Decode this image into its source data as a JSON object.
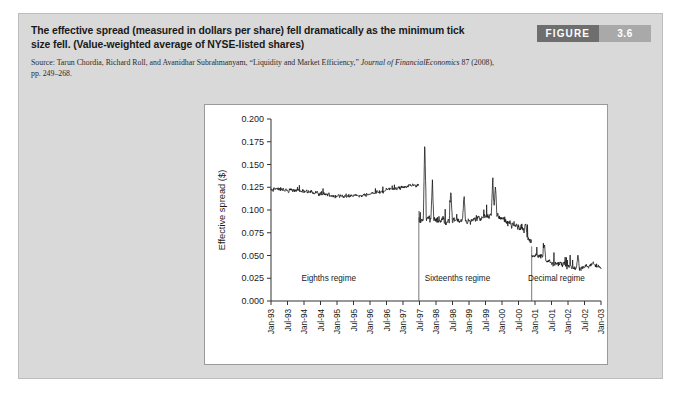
{
  "figure": {
    "badge_word": "FIGURE",
    "badge_number": "3.6",
    "title": "The effective spread (measured in dollars per share) fell dramatically as the minimum tick size fell. (Value-weighted average of NYSE-listed shares)",
    "source_line1": "Source: Tarun Chordia, Richard Roll, and Avanidhar Subrahmanyam, “Liquidity and Market Efficiency,” ",
    "source_italic1": "Journal of Financial",
    "source_italic2": "Economics",
    "source_line2": " 87 (2008), pp. 249–268.",
    "badge_color_word": "#6e6e6e",
    "badge_color_num": "#a9a9a9",
    "card_bg": "#d9d9d9",
    "plot_bg": "#ffffff",
    "line_color": "#111111"
  },
  "chart_data": {
    "type": "line",
    "title": "",
    "xlabel": "",
    "ylabel": "Effective spread ($)",
    "ylim": [
      0.0,
      0.2
    ],
    "ytick_values": [
      0.0,
      0.025,
      0.05,
      0.075,
      0.1,
      0.125,
      0.15,
      0.175,
      0.2
    ],
    "ytick_labels": [
      "0.000",
      "0.025",
      "0.050",
      "0.075",
      "0.100",
      "0.125",
      "0.150",
      "0.175",
      "0.200"
    ],
    "grid": false,
    "legend": "none",
    "xtick_labels": [
      "Jan-93",
      "Jul-93",
      "Jan-94",
      "Jul-94",
      "Jan-95",
      "Jul-95",
      "Jan-96",
      "Jul-96",
      "Jan-97",
      "Jul-97",
      "Jan-98",
      "Jul-98",
      "Jan-99",
      "Jul-99",
      "Jan-00",
      "Jul-00",
      "Jan-01",
      "Jul-01",
      "Jan-02",
      "Jul-02",
      "Jan-03"
    ],
    "x_range": [
      "Jan-93",
      "Jan-03"
    ],
    "series_name": "Effective spread (value-weighted average, NYSE-listed shares)",
    "annotations": [
      {
        "label": "Eighths regime",
        "x_fraction": 0.175,
        "y_value": 0.0215
      },
      {
        "label": "Sixteenths regime",
        "x_fraction": 0.565,
        "y_value": 0.0215
      },
      {
        "label": "Decimal regime",
        "x_fraction": 0.865,
        "y_value": 0.0215
      }
    ],
    "regime_dividers": [
      {
        "label": "eighths-to-sixteenths",
        "x_fraction": 0.448,
        "y_top": 0.092,
        "y_bottom": 0.0
      },
      {
        "label": "sixteenths-to-decimal",
        "x_fraction": 0.79,
        "y_top": 0.06,
        "y_bottom": 0.0
      }
    ],
    "regimes": [
      {
        "name": "Eighths regime",
        "x_start": 0.0,
        "x_end": 0.448,
        "level_start": 0.1205,
        "level_end": 0.1245,
        "approx_mean": 0.121
      },
      {
        "name": "Sixteenths regime",
        "x_start": 0.448,
        "x_end": 0.79,
        "level_start": 0.089,
        "level_end": 0.0745,
        "approx_mean": 0.088
      },
      {
        "name": "Decimal regime",
        "x_start": 0.79,
        "x_end": 1.0,
        "level_start": 0.0465,
        "level_end": 0.0335,
        "approx_mean": 0.04
      }
    ],
    "notable_peaks": [
      {
        "x_fraction": 0.466,
        "y_value": 0.178
      },
      {
        "x_fraction": 0.489,
        "y_value": 0.133
      },
      {
        "x_fraction": 0.545,
        "y_value": 0.122
      },
      {
        "x_fraction": 0.585,
        "y_value": 0.116
      },
      {
        "x_fraction": 0.672,
        "y_value": 0.133
      },
      {
        "x_fraction": 0.68,
        "y_value": 0.128
      },
      {
        "x_fraction": 0.772,
        "y_value": 0.086
      },
      {
        "x_fraction": 0.828,
        "y_value": 0.064
      },
      {
        "x_fraction": 0.93,
        "y_value": 0.052
      }
    ],
    "series_note": "Monthly/weekly value-weighted average effective spread in dollars per share, NYSE-listed shares, Jan-1993 through Jan-2003."
  }
}
